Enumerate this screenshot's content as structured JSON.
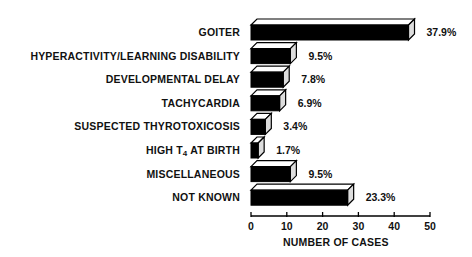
{
  "chart_data": {
    "type": "bar",
    "orientation": "horizontal",
    "style": "3d-black-bars",
    "title": "",
    "xlabel": "NUMBER OF CASES",
    "ylabel": "",
    "xlim": [
      0,
      50
    ],
    "xticks": [
      0,
      10,
      20,
      30,
      40,
      50
    ],
    "grid": false,
    "legend": null,
    "categories": [
      "GOITER",
      "HYPERACTIVITY/LEARNING DISABILITY",
      "DEVELOPMENTAL DELAY",
      "TACHYCARDIA",
      "SUSPECTED THYROTOXICOSIS",
      "HIGH T4 AT BIRTH",
      "MISCELLANEOUS",
      "NOT KNOWN"
    ],
    "values": [
      44,
      11,
      9,
      8,
      4,
      2,
      11,
      27
    ],
    "percent_labels": [
      "37.9%",
      "9.5%",
      "7.8%",
      "6.9%",
      "3.4%",
      "1.7%",
      "9.5%",
      "23.3%"
    ],
    "bar_color": "#000000"
  },
  "labels": {
    "high_t4_prefix": "HIGH T",
    "high_t4_sub": "4",
    "high_t4_suffix": " AT BIRTH"
  }
}
